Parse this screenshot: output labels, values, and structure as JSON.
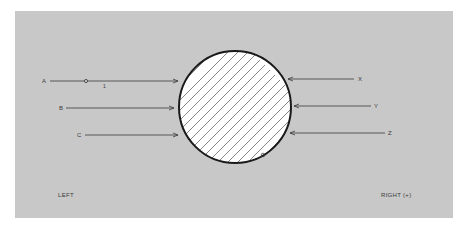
{
  "diagram": {
    "type": "force-diagram",
    "background_color": "#c8c8c8",
    "circle": {
      "fill": "#ffffff",
      "hatch": "diagonal",
      "outline_color": "#1a1a1a"
    },
    "left_arrows": [
      {
        "label": "A",
        "sublabel": "1",
        "has_marker": true
      },
      {
        "label": "B"
      },
      {
        "label": "C"
      }
    ],
    "right_arrows": [
      {
        "label": "X"
      },
      {
        "label": "Y"
      },
      {
        "label": "Z"
      }
    ],
    "side_labels": {
      "left": "LEFT",
      "right": "RIGHT (+)"
    }
  }
}
